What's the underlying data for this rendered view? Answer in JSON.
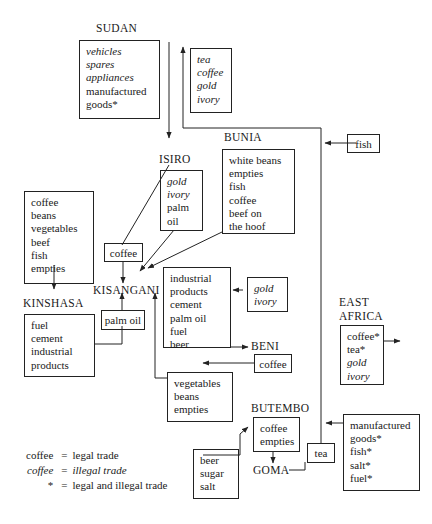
{
  "diagram": {
    "type": "flow-diagram"
  },
  "nodes": {
    "sudan": {
      "label": "SUDAN",
      "items": [
        {
          "text": "vehicles",
          "style": "italic"
        },
        {
          "text": "spares",
          "style": "italic"
        },
        {
          "text": "appliances",
          "style": "italic"
        },
        {
          "text": "manufactured",
          "style": "roman"
        },
        {
          "text": "goods*",
          "style": "roman"
        }
      ]
    },
    "sudan_inbound": {
      "items": [
        {
          "text": "tea",
          "style": "italic"
        },
        {
          "text": "coffee",
          "style": "italic"
        },
        {
          "text": "gold",
          "style": "italic"
        },
        {
          "text": "ivory",
          "style": "italic"
        }
      ]
    },
    "bunia": {
      "label": "BUNIA",
      "items": [
        {
          "text": "white beans",
          "style": "roman"
        },
        {
          "text": "empties",
          "style": "roman"
        },
        {
          "text": "fish",
          "style": "roman"
        },
        {
          "text": "coffee",
          "style": "roman"
        },
        {
          "text": "beef on",
          "style": "roman"
        },
        {
          "text": "the hoof",
          "style": "roman"
        }
      ]
    },
    "fish": {
      "label": "fish"
    },
    "isiro": {
      "label": "ISIRO",
      "items": [
        {
          "text": "gold",
          "style": "italic"
        },
        {
          "text": "ivory",
          "style": "italic"
        },
        {
          "text": "palm",
          "style": "roman"
        },
        {
          "text": "oil",
          "style": "roman"
        }
      ]
    },
    "kisangani_exports_west": {
      "items": [
        {
          "text": "coffee",
          "style": "roman"
        },
        {
          "text": "beans",
          "style": "roman"
        },
        {
          "text": "vegetables",
          "style": "roman"
        },
        {
          "text": "beef",
          "style": "roman"
        },
        {
          "text": "fish",
          "style": "roman"
        },
        {
          "text": "empties",
          "style": "roman"
        }
      ]
    },
    "coffee_isiro": {
      "label": "coffee"
    },
    "kisangani": {
      "label": "KISANGANI"
    },
    "kinshasa": {
      "label": "KINSHASA",
      "items": [
        {
          "text": "fuel",
          "style": "roman"
        },
        {
          "text": "cement",
          "style": "roman"
        },
        {
          "text": "industrial",
          "style": "roman"
        },
        {
          "text": "products",
          "style": "roman"
        }
      ]
    },
    "palm_oil": {
      "label": "palm oil"
    },
    "kisangani_goods": {
      "items": [
        {
          "text": "industrial",
          "style": "roman"
        },
        {
          "text": "products",
          "style": "roman"
        },
        {
          "text": "cement",
          "style": "roman"
        },
        {
          "text": "palm oil",
          "style": "roman"
        },
        {
          "text": "fuel",
          "style": "roman"
        },
        {
          "text": "beer",
          "style": "roman"
        }
      ]
    },
    "gold_ivory": {
      "items": [
        {
          "text": "gold",
          "style": "italic"
        },
        {
          "text": "ivory",
          "style": "italic"
        }
      ]
    },
    "beni": {
      "label": "BENI"
    },
    "coffee_beni": {
      "label": "coffee"
    },
    "east_africa": {
      "label_line1": "EAST",
      "label_line2": "AFRICA",
      "items": [
        {
          "text": "coffee*",
          "style": "roman"
        },
        {
          "text": "tea*",
          "style": "roman"
        },
        {
          "text": "gold",
          "style": "italic"
        },
        {
          "text": "ivory",
          "style": "italic"
        }
      ]
    },
    "vegetables": {
      "items": [
        {
          "text": "vegetables",
          "style": "roman"
        },
        {
          "text": "beans",
          "style": "roman"
        },
        {
          "text": "empties",
          "style": "roman"
        }
      ]
    },
    "butembo": {
      "label": "BUTEMBO",
      "items": [
        {
          "text": "coffee",
          "style": "roman"
        },
        {
          "text": "empties",
          "style": "roman"
        }
      ]
    },
    "beer_sugar_salt": {
      "items": [
        {
          "text": "beer",
          "style": "roman"
        },
        {
          "text": "sugar",
          "style": "roman"
        },
        {
          "text": "salt",
          "style": "roman"
        }
      ]
    },
    "goma": {
      "label": "GOMA"
    },
    "tea": {
      "label": "tea"
    },
    "manufactured": {
      "items": [
        {
          "text": "manufactured",
          "style": "roman"
        },
        {
          "text": "goods*",
          "style": "roman"
        },
        {
          "text": "fish*",
          "style": "roman"
        },
        {
          "text": "salt*",
          "style": "roman"
        },
        {
          "text": "fuel*",
          "style": "roman"
        }
      ]
    }
  },
  "legend": {
    "rows": [
      {
        "key": "coffee",
        "key_style": "roman",
        "eq": "=",
        "value": "legal trade",
        "value_style": "roman"
      },
      {
        "key": "coffee",
        "key_style": "italic",
        "eq": "=",
        "value": "illegal trade",
        "value_style": "italic"
      },
      {
        "key": "*",
        "key_style": "roman",
        "eq": "=",
        "value": "legal and illegal trade",
        "value_style": "roman"
      }
    ]
  }
}
